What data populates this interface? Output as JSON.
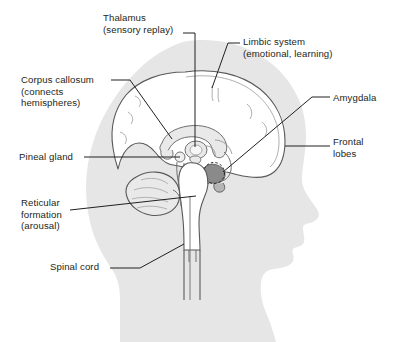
{
  "figure": {
    "colors": {
      "background": "#ffffff",
      "head_silhouette": "#e6e6e6",
      "brain_outline": "#58595b",
      "brain_fill": "#ffffff",
      "inner_structure_fill": "#e9e9e9",
      "amygdala_fill": "#8a8a8a",
      "leader_line": "#231f20",
      "text": "#231f20"
    }
  },
  "labels": [
    {
      "id": "thalamus",
      "name": "thalamus",
      "lines": [
        "Thalamus",
        "(sensory replay)"
      ],
      "align": "left",
      "leader": "vertical-down"
    },
    {
      "id": "limbic",
      "name": "limbic-system",
      "lines": [
        "Limbic system",
        "(emotional, learning)"
      ],
      "align": "left",
      "leader": "diagonal-down-left"
    },
    {
      "id": "corpus",
      "name": "corpus-callosum",
      "lines": [
        "Corpus callosum",
        "(connects",
        "hemispheres)"
      ],
      "align": "left",
      "leader": "diagonal-down-right"
    },
    {
      "id": "amygdala",
      "name": "amygdala",
      "lines": [
        "Amygdala"
      ],
      "align": "left",
      "leader": "diagonal-down-left"
    },
    {
      "id": "frontal",
      "name": "frontal-lobes",
      "lines": [
        "Frontal",
        "lobes"
      ],
      "align": "left",
      "leader": "horizontal-left"
    },
    {
      "id": "pineal",
      "name": "pineal-gland",
      "lines": [
        "Pineal gland"
      ],
      "align": "left",
      "leader": "horizontal-right"
    },
    {
      "id": "reticular",
      "name": "reticular-formation",
      "lines": [
        "Reticular",
        "formation",
        "(arousal)"
      ],
      "align": "left",
      "leader": "diagonal-up-right"
    },
    {
      "id": "spinal",
      "name": "spinal-cord",
      "lines": [
        "Spinal cord"
      ],
      "align": "left",
      "leader": "diagonal-up-right"
    }
  ],
  "structures": [
    {
      "name": "head-silhouette",
      "label": "Head profile silhouette"
    },
    {
      "name": "cerebrum",
      "label": "Cerebrum (cerebral cortex outline)"
    },
    {
      "name": "corpus-callosum-shape",
      "label": "Corpus callosum band"
    },
    {
      "name": "thalamus-shape",
      "label": "Thalamus"
    },
    {
      "name": "pineal-gland-shape",
      "label": "Pineal gland"
    },
    {
      "name": "amygdala-shape",
      "label": "Amygdala (shaded, dashed circle)"
    },
    {
      "name": "cerebellum",
      "label": "Cerebellum"
    },
    {
      "name": "brainstem",
      "label": "Brainstem / medulla"
    },
    {
      "name": "spinal-cord-shape",
      "label": "Spinal cord"
    }
  ]
}
